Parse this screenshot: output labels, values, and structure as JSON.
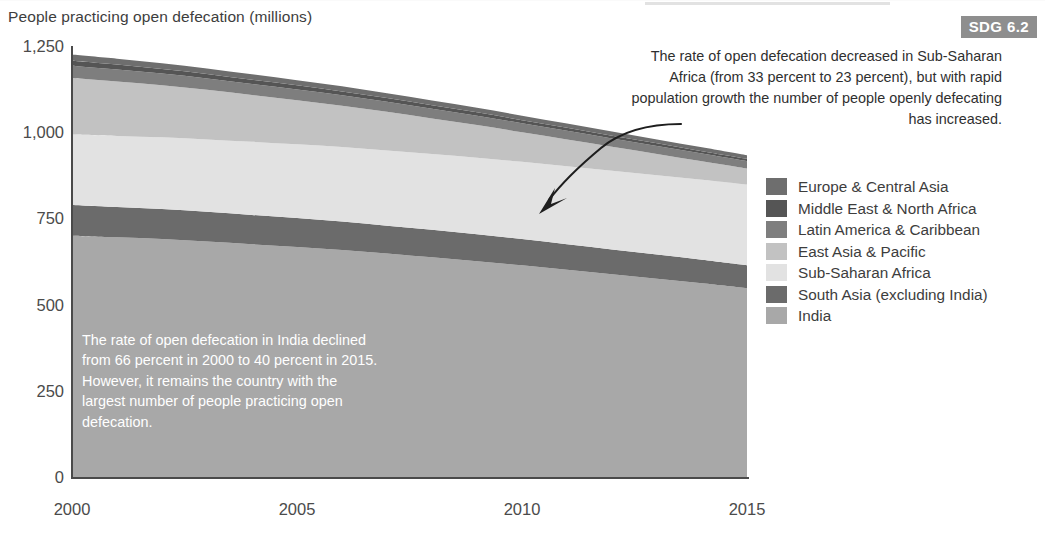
{
  "chart_title": "People practicing open defecation (millions)",
  "badge": {
    "label": "SDG 6.2"
  },
  "annotations": {
    "ssa": "The rate of open defecation decreased in Sub-Saharan Africa (from 33 percent to 23 percent), but with rapid population growth the number of people openly defecating has increased.",
    "india": "The rate of open defecation in India declined from 66 percent in 2000 to 40 percent in 2015. However, it remains the country with the largest number of people practicing open defecation."
  },
  "legend": {
    "items": [
      {
        "label": "Europe & Central Asia",
        "color": "#6e6e6e"
      },
      {
        "label": "Middle East & North Africa",
        "color": "#555555"
      },
      {
        "label": "Latin America & Caribbean",
        "color": "#7e7e7e"
      },
      {
        "label": "East Asia & Pacific",
        "color": "#c2c2c2"
      },
      {
        "label": "Sub-Saharan Africa",
        "color": "#e2e2e2"
      },
      {
        "label": "South Asia (excluding India)",
        "color": "#6b6b6b"
      },
      {
        "label": "India",
        "color": "#a8a8a8"
      }
    ]
  },
  "chart_data": {
    "type": "area",
    "stacked": true,
    "title": "People practicing open defecation (millions)",
    "xlabel": "",
    "ylabel": "People practicing open defecation (millions)",
    "x": [
      2000,
      2001,
      2002,
      2003,
      2004,
      2005,
      2006,
      2007,
      2008,
      2009,
      2010,
      2011,
      2012,
      2013,
      2014,
      2015
    ],
    "xticks": [
      "2000",
      "2005",
      "2010",
      "2015"
    ],
    "xlim": [
      2000,
      2015
    ],
    "yticks": [
      "0",
      "250",
      "500",
      "750",
      "1,000",
      "1,250"
    ],
    "ytickvalues": [
      0,
      250,
      500,
      750,
      1000,
      1250
    ],
    "ylim": [
      0,
      1250
    ],
    "grid": false,
    "legend_position": "right",
    "stack_order_bottom_to_top": [
      "India",
      "South Asia (excluding India)",
      "Sub-Saharan Africa",
      "East Asia & Pacific",
      "Latin America & Caribbean",
      "Middle East & North Africa",
      "Europe & Central Asia"
    ],
    "series": [
      {
        "name": "India",
        "color": "#a8a8a8",
        "values": [
          700,
          695,
          690,
          683,
          675,
          667,
          658,
          648,
          637,
          626,
          614,
          601,
          588,
          575,
          562,
          548
        ]
      },
      {
        "name": "South Asia (excluding India)",
        "color": "#6b6b6b",
        "values": [
          89,
          88,
          87,
          86,
          85,
          84,
          83,
          81,
          80,
          78,
          76,
          74,
          72,
          70,
          68,
          66
        ]
      },
      {
        "name": "Sub-Saharan Africa",
        "color": "#e2e2e2",
        "values": [
          204,
          206,
          208,
          210,
          212,
          214,
          216,
          218,
          220,
          222,
          224,
          226,
          228,
          230,
          232,
          234
        ]
      },
      {
        "name": "East Asia & Pacific",
        "color": "#c2c2c2",
        "values": [
          164,
          158,
          151,
          144,
          136,
          128,
          120,
          112,
          103,
          95,
          86,
          78,
          70,
          62,
          54,
          47
        ]
      },
      {
        "name": "Latin America & Caribbean",
        "color": "#7e7e7e",
        "values": [
          36,
          35,
          34,
          33,
          32,
          31,
          30,
          29,
          28,
          27,
          26,
          25,
          24,
          23,
          22,
          21
        ]
      },
      {
        "name": "Middle East & North Africa",
        "color": "#555555",
        "values": [
          14,
          14,
          13,
          13,
          12,
          12,
          11,
          11,
          10,
          10,
          9,
          9,
          8,
          8,
          7,
          7
        ]
      },
      {
        "name": "Europe & Central Asia",
        "color": "#6e6e6e",
        "values": [
          18,
          17,
          17,
          16,
          16,
          15,
          15,
          14,
          14,
          13,
          13,
          12,
          12,
          11,
          11,
          10
        ]
      }
    ],
    "totals": [
      1225,
      1213,
      1200,
      1185,
      1168,
      1151,
      1133,
      1113,
      1092,
      1071,
      1048,
      1025,
      1002,
      979,
      956,
      933
    ]
  }
}
